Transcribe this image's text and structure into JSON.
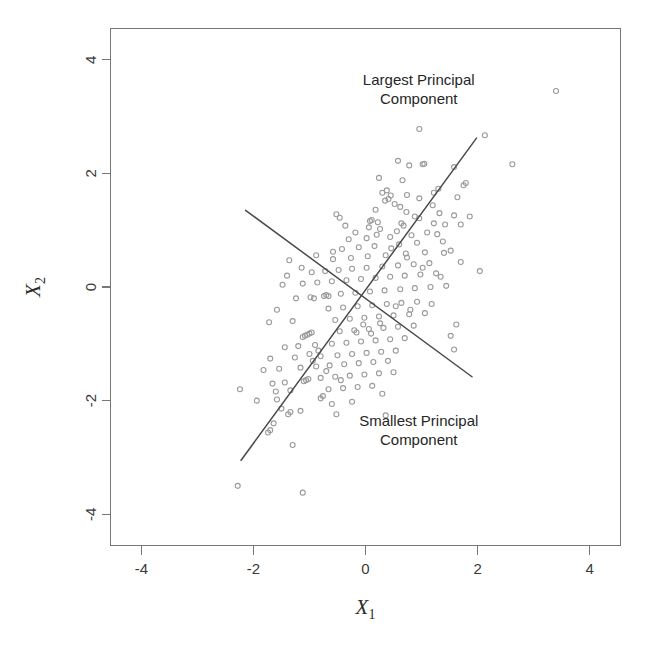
{
  "figure": {
    "background_color": "#ffffff",
    "point_color": "#9a9a9a",
    "line_color": "#4a4a4a",
    "axis_color": "#777777",
    "text_color": "#262626"
  },
  "annotations": [
    {
      "name": "largest-principal-component-label",
      "line1": "Largest Principal",
      "line2": "Component",
      "x": 0.95,
      "y": 3.55
    },
    {
      "name": "smallest-principal-component-label",
      "line1": "Smallest Principal",
      "line2": "Component",
      "x": 0.95,
      "y": -2.45
    }
  ],
  "chart_data": {
    "type": "scatter",
    "title": "",
    "xlabel": "X1",
    "ylabel": "X2",
    "xlabel_base": "X",
    "xlabel_sub": "1",
    "ylabel_base": "X",
    "ylabel_sub": "2",
    "xlim": [
      -4.55,
      4.55
    ],
    "ylim": [
      -4.55,
      4.55
    ],
    "xticks": [
      -4,
      -2,
      0,
      2,
      4
    ],
    "yticks": [
      -4,
      -2,
      0,
      2,
      4
    ],
    "xticklabels": [
      "-4",
      "-2",
      "0",
      "2",
      "4"
    ],
    "yticklabels": [
      "-4",
      "-2",
      "0",
      "2",
      "4"
    ],
    "grid": false,
    "legend": "none",
    "marker": "open-circle",
    "marker_size": 5,
    "n_points": 224,
    "series": [
      {
        "name": "observations",
        "points": [
          [
            3.4,
            3.45
          ],
          [
            2.62,
            2.16
          ],
          [
            2.13,
            2.67
          ],
          [
            0.96,
            2.78
          ],
          [
            1.58,
            2.11
          ],
          [
            1.05,
            2.17
          ],
          [
            1.02,
            2.16
          ],
          [
            0.58,
            2.22
          ],
          [
            0.78,
            2.14
          ],
          [
            1.79,
            1.83
          ],
          [
            1.75,
            1.79
          ],
          [
            1.3,
            1.73
          ],
          [
            0.38,
            1.7
          ],
          [
            0.3,
            1.66
          ],
          [
            0.45,
            1.61
          ],
          [
            0.41,
            1.55
          ],
          [
            0.35,
            1.52
          ],
          [
            0.52,
            1.46
          ],
          [
            1.2,
            1.44
          ],
          [
            0.62,
            1.41
          ],
          [
            0.18,
            1.36
          ],
          [
            0.73,
            1.32
          ],
          [
            1.32,
            1.3
          ],
          [
            1.58,
            1.26
          ],
          [
            0.88,
            1.24
          ],
          [
            0.96,
            1.21
          ],
          [
            0.11,
            1.18
          ],
          [
            0.08,
            1.16
          ],
          [
            0.22,
            1.14
          ],
          [
            1.22,
            1.12
          ],
          [
            1.42,
            1.1
          ],
          [
            0.68,
            1.08
          ],
          [
            0.06,
            1.05
          ],
          [
            0.26,
            1.02
          ],
          [
            0.56,
            0.98
          ],
          [
            1.1,
            0.96
          ],
          [
            1.28,
            0.93
          ],
          [
            0.82,
            0.91
          ],
          [
            0.44,
            0.88
          ],
          [
            0.02,
            0.86
          ],
          [
            -0.3,
            0.84
          ],
          [
            1.38,
            0.8
          ],
          [
            0.92,
            0.78
          ],
          [
            0.6,
            0.75
          ],
          [
            0.16,
            0.72
          ],
          [
            -0.12,
            0.7
          ],
          [
            -0.42,
            0.67
          ],
          [
            1.52,
            0.64
          ],
          [
            1.06,
            0.61
          ],
          [
            0.72,
            0.59
          ],
          [
            0.36,
            0.56
          ],
          [
            0.04,
            0.54
          ],
          [
            -0.26,
            0.51
          ],
          [
            -0.58,
            0.49
          ],
          [
            -1.36,
            0.47
          ],
          [
            1.7,
            0.44
          ],
          [
            1.14,
            0.42
          ],
          [
            0.86,
            0.4
          ],
          [
            0.58,
            0.38
          ],
          [
            0.3,
            0.36
          ],
          [
            0.02,
            0.34
          ],
          [
            -0.24,
            0.32
          ],
          [
            -0.48,
            0.3
          ],
          [
            -0.72,
            0.28
          ],
          [
            -0.96,
            0.26
          ],
          [
            1.26,
            0.24
          ],
          [
            0.98,
            0.22
          ],
          [
            0.7,
            0.2
          ],
          [
            0.44,
            0.18
          ],
          [
            0.18,
            0.16
          ],
          [
            -0.08,
            0.14
          ],
          [
            -0.34,
            0.12
          ],
          [
            -0.6,
            0.1
          ],
          [
            -0.86,
            0.08
          ],
          [
            -1.12,
            0.06
          ],
          [
            -1.48,
            0.04
          ],
          [
            1.44,
            0.02
          ],
          [
            1.16,
            0.0
          ],
          [
            0.88,
            -0.02
          ],
          [
            0.62,
            -0.04
          ],
          [
            0.34,
            -0.06
          ],
          [
            0.08,
            -0.08
          ],
          [
            -0.18,
            -0.1
          ],
          [
            -0.44,
            -0.12
          ],
          [
            -0.7,
            -0.14
          ],
          [
            -0.74,
            -0.16
          ],
          [
            -0.98,
            -0.18
          ],
          [
            -1.24,
            -0.2
          ],
          [
            0.92,
            -0.26
          ],
          [
            0.64,
            -0.28
          ],
          [
            0.38,
            -0.3
          ],
          [
            0.12,
            -0.32
          ],
          [
            -0.14,
            -0.34
          ],
          [
            -0.4,
            -0.36
          ],
          [
            -0.66,
            -0.38
          ],
          [
            -1.58,
            -0.4
          ],
          [
            1.06,
            -0.46
          ],
          [
            0.78,
            -0.48
          ],
          [
            0.5,
            -0.5
          ],
          [
            0.24,
            -0.52
          ],
          [
            -0.02,
            -0.54
          ],
          [
            -0.28,
            -0.56
          ],
          [
            -0.54,
            -0.58
          ],
          [
            -1.3,
            -0.6
          ],
          [
            -1.72,
            -0.62
          ],
          [
            1.62,
            -0.66
          ],
          [
            0.86,
            -0.68
          ],
          [
            0.58,
            -0.7
          ],
          [
            0.32,
            -0.72
          ],
          [
            0.06,
            -0.74
          ],
          [
            -0.2,
            -0.76
          ],
          [
            -0.46,
            -0.78
          ],
          [
            -0.96,
            -0.8
          ],
          [
            -1.0,
            -0.82
          ],
          [
            -1.04,
            -0.84
          ],
          [
            -1.08,
            -0.86
          ],
          [
            -1.12,
            -0.88
          ],
          [
            0.7,
            -0.9
          ],
          [
            0.44,
            -0.92
          ],
          [
            0.18,
            -0.94
          ],
          [
            -0.08,
            -0.96
          ],
          [
            -0.34,
            -0.98
          ],
          [
            -0.6,
            -1.0
          ],
          [
            -0.9,
            -1.02
          ],
          [
            -1.2,
            -1.04
          ],
          [
            -1.44,
            -1.06
          ],
          [
            1.58,
            -1.1
          ],
          [
            0.54,
            -1.12
          ],
          [
            0.28,
            -1.14
          ],
          [
            0.02,
            -1.16
          ],
          [
            -0.24,
            -1.18
          ],
          [
            -0.5,
            -1.2
          ],
          [
            -0.8,
            -1.22
          ],
          [
            -1.26,
            -1.24
          ],
          [
            -1.7,
            -1.26
          ],
          [
            0.4,
            -1.3
          ],
          [
            0.14,
            -1.32
          ],
          [
            -0.12,
            -1.34
          ],
          [
            -0.38,
            -1.36
          ],
          [
            -0.64,
            -1.38
          ],
          [
            -0.88,
            -1.4
          ],
          [
            -1.16,
            -1.42
          ],
          [
            -1.54,
            -1.44
          ],
          [
            -1.82,
            -1.46
          ],
          [
            0.5,
            -1.5
          ],
          [
            0.24,
            -1.52
          ],
          [
            -0.02,
            -1.54
          ],
          [
            -0.28,
            -1.56
          ],
          [
            -0.54,
            -1.58
          ],
          [
            -0.8,
            -1.6
          ],
          [
            -1.02,
            -1.62
          ],
          [
            -1.06,
            -1.64
          ],
          [
            -1.1,
            -1.66
          ],
          [
            -1.44,
            -1.68
          ],
          [
            -1.66,
            -1.7
          ],
          [
            0.12,
            -1.74
          ],
          [
            -0.14,
            -1.76
          ],
          [
            -0.4,
            -1.78
          ],
          [
            -0.66,
            -1.8
          ],
          [
            -1.34,
            -1.82
          ],
          [
            -1.6,
            -1.84
          ],
          [
            -2.24,
            -1.8
          ],
          [
            -0.76,
            -1.92
          ],
          [
            -0.8,
            -1.96
          ],
          [
            -1.58,
            -1.98
          ],
          [
            -1.94,
            -2.0
          ],
          [
            -0.52,
            -2.24
          ],
          [
            -1.16,
            -2.18
          ],
          [
            -1.34,
            -2.2
          ],
          [
            -1.38,
            -2.24
          ],
          [
            -1.64,
            -2.4
          ],
          [
            -1.7,
            -2.52
          ],
          [
            -1.74,
            -2.56
          ],
          [
            -1.3,
            -2.78
          ],
          [
            -2.28,
            -3.5
          ],
          [
            -1.12,
            -3.62
          ],
          [
            0.66,
            1.88
          ],
          [
            0.24,
            1.92
          ],
          [
            1.64,
            1.58
          ],
          [
            1.22,
            1.66
          ],
          [
            -0.52,
            1.28
          ],
          [
            -0.46,
            1.22
          ],
          [
            -0.58,
            0.62
          ],
          [
            -0.88,
            0.56
          ],
          [
            -1.14,
            0.34
          ],
          [
            -1.4,
            0.2
          ],
          [
            -0.66,
            -0.16
          ],
          [
            -0.92,
            -0.2
          ],
          [
            0.46,
            0.68
          ],
          [
            0.74,
            0.52
          ],
          [
            1.02,
            0.34
          ],
          [
            1.34,
            0.18
          ],
          [
            0.26,
            -0.64
          ],
          [
            -0.04,
            -0.66
          ],
          [
            0.54,
            -0.34
          ],
          [
            0.8,
            -0.4
          ],
          [
            1.18,
            -0.3
          ],
          [
            1.4,
            0.6
          ],
          [
            0.2,
            0.92
          ],
          [
            -0.18,
            0.96
          ],
          [
            -0.36,
            1.08
          ],
          [
            0.64,
            1.12
          ],
          [
            0.96,
            1.56
          ],
          [
            0.74,
            1.62
          ],
          [
            -0.84,
            -1.12
          ],
          [
            -1.0,
            -1.18
          ],
          [
            -0.94,
            -1.3
          ],
          [
            -0.7,
            -1.48
          ],
          [
            -0.44,
            -1.64
          ],
          [
            0.3,
            -1.88
          ],
          [
            -0.24,
            -2.02
          ],
          [
            -0.6,
            -2.06
          ],
          [
            0.36,
            -2.26
          ],
          [
            -1.5,
            -2.14
          ],
          [
            -0.16,
            -0.8
          ],
          [
            0.1,
            -0.82
          ],
          [
            1.86,
            1.24
          ],
          [
            2.04,
            0.28
          ],
          [
            1.7,
            1.1
          ],
          [
            1.52,
            -0.86
          ]
        ]
      }
    ],
    "reference_lines": [
      {
        "name": "largest-principal-component-line",
        "x1": -2.22,
        "y1": -3.05,
        "x2": 1.98,
        "y2": 2.62
      },
      {
        "name": "smallest-principal-component-line",
        "x1": -2.14,
        "y1": 1.35,
        "x2": 1.9,
        "y2": -1.58
      }
    ]
  }
}
